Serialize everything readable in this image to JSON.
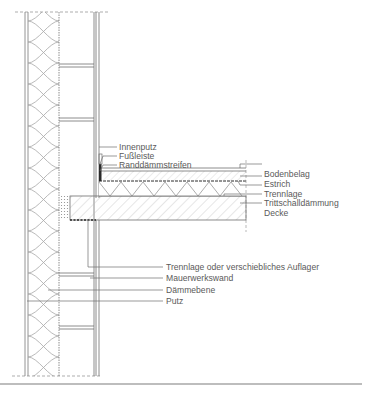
{
  "diagram": {
    "colors": {
      "line": "#6e6e6e",
      "dark_line": "#3a3a3a",
      "hatch": "#b5b5b5",
      "text": "#5a5a5a",
      "rule": "#bdbdbd"
    },
    "labels": {
      "innenputz": "Innenputz",
      "fussleiste": "Fußleiste",
      "randdaemmstreifen": "Randdämmstreifen",
      "bodenbelag": "Bodenbelag",
      "estrich": "Estrich",
      "trennlage": "Trennlage",
      "trittschalldaemmung": "Trittschalldämmung",
      "decke": "Decke",
      "trennlage_auflager": "Trennlage oder verschiebliches Auflager",
      "mauerwerkswand": "Mauerwerkswand",
      "daemmebene": "Dämmebene",
      "putz": "Putz"
    }
  }
}
